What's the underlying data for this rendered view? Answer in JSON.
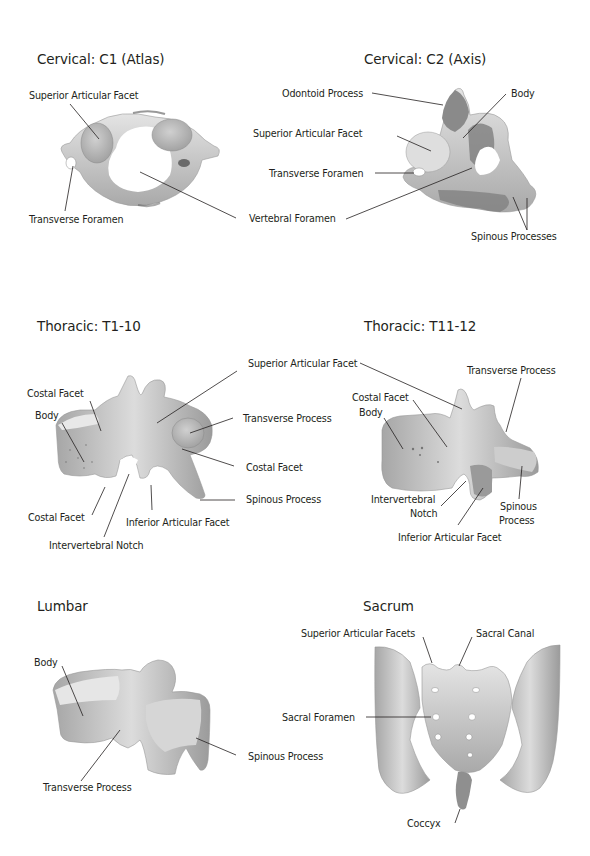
{
  "page": {
    "background": "#ffffff",
    "text_color": "#231f20",
    "bone_color": "#cfcfcf",
    "bone_shadow": "#8c8c8c"
  },
  "panels": {
    "c1": {
      "title": "Cervical: C1 (Atlas)",
      "labels": {
        "superior_articular_facet": "Superior Articular Facet",
        "transverse_foramen": "Transverse Foramen",
        "vertebral_foramen": "Vertebral Foramen"
      }
    },
    "c2": {
      "title": "Cervical: C2 (Axis)",
      "labels": {
        "odontoid_process": "Odontoid Process",
        "body": "Body",
        "superior_articular_facet": "Superior Articular Facet",
        "transverse_foramen": "Transverse Foramen",
        "spinous_processes": "Spinous Processes"
      }
    },
    "t1_10": {
      "title": "Thoracic: T1-10",
      "labels": {
        "superior_articular_facet": "Superior Articular Facet",
        "costal_facet_top": "Costal Facet",
        "body": "Body",
        "transverse_process": "Transverse Process",
        "costal_facet_right": "Costal Facet",
        "spinous_process": "Spinous Process",
        "costal_facet_bottom": "Costal Facet",
        "inferior_articular_facet": "Inferior Articular Facet",
        "intervertebral_notch": "Intervertebral Notch"
      }
    },
    "t11_12": {
      "title": "Thoracic: T11-12",
      "labels": {
        "transverse_process": "Transverse Process",
        "costal_facet": "Costal Facet",
        "body": "Body",
        "intervertebral_notch_1": "Intervertebral",
        "intervertebral_notch_2": "Notch",
        "spinous_process_1": "Spinous",
        "spinous_process_2": "Process",
        "inferior_articular_facet": "Inferior Articular Facet"
      }
    },
    "lumbar": {
      "title": "Lumbar",
      "labels": {
        "body": "Body",
        "spinous_process": "Spinous Process",
        "transverse_process": "Transverse Process"
      }
    },
    "sacrum": {
      "title": "Sacrum",
      "labels": {
        "superior_articular_facets": "Superior Articular Facets",
        "sacral_canal": "Sacral Canal",
        "sacral_foramen": "Sacral Foramen",
        "coccyx": "Coccyx"
      }
    }
  }
}
